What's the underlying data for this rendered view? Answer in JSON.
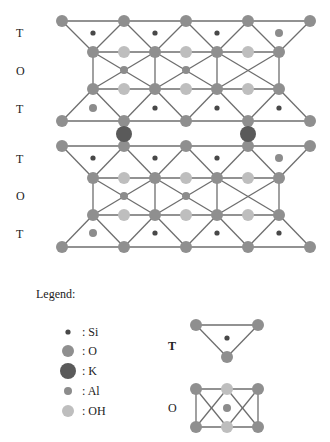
{
  "figure": {
    "layer_labels": [
      {
        "text": "T",
        "y": 33
      },
      {
        "text": "O",
        "y": 71
      },
      {
        "text": "T",
        "y": 109
      },
      {
        "text": "T",
        "y": 159
      },
      {
        "text": "O",
        "y": 196
      },
      {
        "text": "T",
        "y": 234
      }
    ],
    "blocks": [
      {
        "top_o_y": 21,
        "t1_dot_y": 33,
        "o_upper_y": 52,
        "o_center_y": 70,
        "o_lower_y": 89,
        "t2_dot_y": 108,
        "bottom_o_y": 121,
        "top_t_dots": [
          "Si",
          "Si",
          "Si",
          "Al"
        ],
        "bottom_t_dots": [
          "Al",
          "Si",
          "Si",
          "Si"
        ],
        "octa_centers": [
          "Al",
          "Al",
          null
        ]
      },
      {
        "top_o_y": 146,
        "t1_dot_y": 158,
        "o_upper_y": 178,
        "o_center_y": 196,
        "o_lower_y": 215,
        "t2_dot_y": 233,
        "bottom_o_y": 247,
        "top_t_dots": [
          "Si",
          "Si",
          "Si",
          "Al"
        ],
        "bottom_t_dots": [
          "Al",
          "Si",
          "Si",
          "Si"
        ],
        "octa_centers": [
          "Al",
          "Al",
          null
        ]
      }
    ],
    "interlayer": {
      "species": "K",
      "y": 134,
      "x": [
        124,
        248
      ]
    },
    "outer_x": [
      62,
      124,
      186,
      248,
      310
    ],
    "inner_x": [
      93,
      155,
      217,
      279
    ],
    "mid_x": [
      124,
      186,
      248
    ]
  },
  "legend": {
    "title": "Legend:",
    "items": [
      {
        "species": "Si",
        "label": ": Si"
      },
      {
        "species": "O",
        "label": ": O"
      },
      {
        "species": "K",
        "label": ": K"
      },
      {
        "species": "Al",
        "label": ": Al"
      },
      {
        "species": "OH",
        "label": ": OH"
      }
    ],
    "tetrahedron_label": "T",
    "octahedron_label": "O"
  },
  "species_style": {
    "Si": {
      "color": "#484848",
      "r": 2.6
    },
    "O": {
      "color": "#8f8f8f",
      "r": 6
    },
    "K": {
      "color": "#5a5a5a",
      "r": 8
    },
    "Al": {
      "color": "#8c8c8c",
      "r": 4
    },
    "OH": {
      "color": "#bebebe",
      "r": 6
    }
  },
  "line_color": "#6e6e6e"
}
